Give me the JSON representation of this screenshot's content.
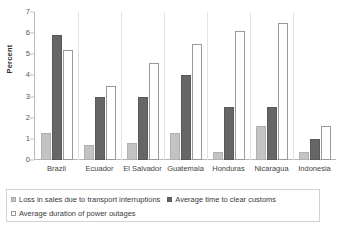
{
  "chart_data": {
    "type": "bar",
    "title": "",
    "xlabel": "",
    "ylabel": "Percent",
    "ylim": [
      0,
      7
    ],
    "yticks": [
      0,
      1,
      2,
      3,
      4,
      5,
      6,
      7
    ],
    "grid": false,
    "legend_position": "bottom",
    "categories": [
      "Brazil",
      "Ecuador",
      "El Salvador",
      "Guatemala",
      "Honduras",
      "Nicaragua",
      "Indonesia"
    ],
    "series": [
      {
        "name": "Loss in sales due to transport interruptions",
        "color": "#c3c3c3",
        "values": [
          1.3,
          0.7,
          0.8,
          1.3,
          0.4,
          1.6,
          0.4
        ]
      },
      {
        "name": "Average time to clear customs",
        "color": "#666666",
        "values": [
          5.9,
          3.0,
          3.0,
          4.0,
          2.5,
          2.5,
          1.0
        ]
      },
      {
        "name": "Average duration of power outages",
        "color": "#ffffff",
        "values": [
          5.2,
          3.5,
          4.6,
          5.5,
          6.1,
          6.5,
          1.6
        ]
      }
    ]
  },
  "axis": {
    "y_title": "Percent",
    "y_tick_labels": [
      "0",
      "1",
      "2",
      "3",
      "4",
      "5",
      "6",
      "7"
    ]
  },
  "legend": {
    "items": [
      "Loss in sales due to transport interruptions",
      "Average time to clear customs",
      "Average duration of power outages"
    ]
  }
}
